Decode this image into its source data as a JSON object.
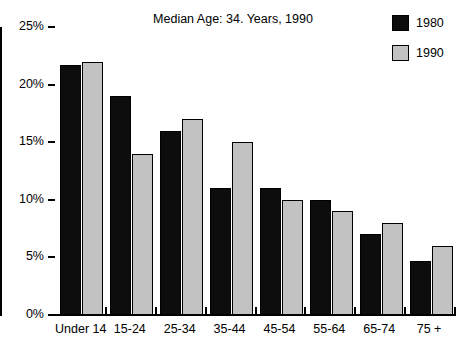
{
  "chart_data": {
    "type": "bar",
    "title": "Median Age: 34. Years, 1990",
    "xlabel": "",
    "ylabel": "",
    "ylim": [
      0,
      25
    ],
    "ytick_labels": [
      "0%",
      "5%",
      "10%",
      "15%",
      "20%",
      "25%"
    ],
    "ytick_values": [
      0,
      5,
      10,
      15,
      20,
      25
    ],
    "grid": false,
    "legend_position": "top-right",
    "categories": [
      "Under 14",
      "15-24",
      "25-34",
      "35-44",
      "45-54",
      "55-64",
      "65-74",
      "75 +"
    ],
    "series": [
      {
        "name": "1980",
        "color": "#0d0d0d",
        "values": [
          21.7,
          19.0,
          16.0,
          11.0,
          11.0,
          10.0,
          7.0,
          4.7
        ]
      },
      {
        "name": "1990",
        "color": "#c2c2c2",
        "values": [
          22.0,
          14.0,
          17.0,
          15.0,
          10.0,
          9.0,
          8.0,
          6.0
        ]
      }
    ]
  },
  "legend": {
    "items": [
      {
        "label": "1980",
        "color": "#0d0d0d"
      },
      {
        "label": "1990",
        "color": "#c2c2c2"
      }
    ]
  }
}
